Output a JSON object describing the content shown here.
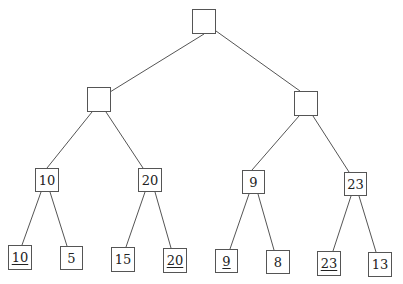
{
  "diagram": {
    "type": "binary-tree",
    "nodes": [
      {
        "id": "root",
        "label": "",
        "x": 192,
        "y": 9,
        "w": 24,
        "h": 25,
        "underline": false
      },
      {
        "id": "l",
        "label": "",
        "x": 87,
        "y": 87,
        "w": 24,
        "h": 25,
        "underline": false
      },
      {
        "id": "r",
        "label": "",
        "x": 294,
        "y": 91,
        "w": 24,
        "h": 25,
        "underline": false
      },
      {
        "id": "ll",
        "label": "10",
        "x": 35,
        "y": 168,
        "w": 24,
        "h": 24,
        "underline": false
      },
      {
        "id": "lr",
        "label": "20",
        "x": 138,
        "y": 168,
        "w": 24,
        "h": 24,
        "underline": false
      },
      {
        "id": "rl",
        "label": "9",
        "x": 242,
        "y": 170,
        "w": 23,
        "h": 24,
        "underline": false
      },
      {
        "id": "rr",
        "label": "23",
        "x": 344,
        "y": 172,
        "w": 23,
        "h": 24,
        "underline": false
      },
      {
        "id": "lll",
        "label": "10",
        "x": 8,
        "y": 245,
        "w": 24,
        "h": 25,
        "underline": true
      },
      {
        "id": "llr",
        "label": "5",
        "x": 60,
        "y": 246,
        "w": 23,
        "h": 24,
        "underline": false
      },
      {
        "id": "lrl",
        "label": "15",
        "x": 111,
        "y": 247,
        "w": 24,
        "h": 25,
        "underline": false
      },
      {
        "id": "lrr",
        "label": "20",
        "x": 163,
        "y": 248,
        "w": 24,
        "h": 25,
        "underline": true
      },
      {
        "id": "rll",
        "label": "9",
        "x": 215,
        "y": 249,
        "w": 23,
        "h": 24,
        "underline": true
      },
      {
        "id": "rlr",
        "label": "8",
        "x": 266,
        "y": 250,
        "w": 24,
        "h": 24,
        "underline": false
      },
      {
        "id": "rrl",
        "label": "23",
        "x": 317,
        "y": 251,
        "w": 24,
        "h": 25,
        "underline": true
      },
      {
        "id": "rrr",
        "label": "13",
        "x": 368,
        "y": 252,
        "w": 24,
        "h": 25,
        "underline": false
      }
    ],
    "edges": [
      [
        204,
        34,
        110,
        92
      ],
      [
        216,
        31,
        300,
        91
      ],
      [
        92,
        112,
        47,
        168
      ],
      [
        106,
        112,
        143,
        168
      ],
      [
        299,
        116,
        252,
        170
      ],
      [
        313,
        116,
        349,
        172
      ],
      [
        41,
        192,
        22,
        245
      ],
      [
        50,
        192,
        67,
        246
      ],
      [
        145,
        192,
        126,
        247
      ],
      [
        155,
        192,
        171,
        248
      ],
      [
        249,
        194,
        230,
        249
      ],
      [
        258,
        194,
        274,
        250
      ],
      [
        351,
        196,
        333,
        251
      ],
      [
        359,
        196,
        376,
        252
      ]
    ]
  }
}
